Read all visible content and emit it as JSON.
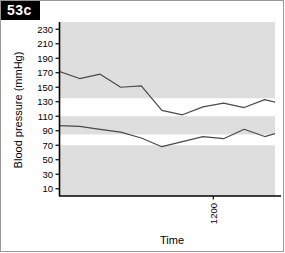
{
  "panel": {
    "tag": "53c"
  },
  "chart_data": {
    "type": "line",
    "title": "",
    "xlabel": "Time",
    "ylabel": "Blood pressure (mmHg)",
    "ylim": [
      0,
      240
    ],
    "yticks": [
      230,
      210,
      190,
      170,
      150,
      130,
      110,
      90,
      70,
      50,
      30,
      10
    ],
    "xlim": [
      1050,
      1260
    ],
    "xticks": [
      1200,
      1500,
      1800,
      2100,
      2400,
      2700,
      3000,
      3300,
      3600
    ],
    "xticklabels": [
      "1200",
      "1500",
      "1800",
      "2100",
      "0000",
      "0300",
      "0600",
      "0900",
      "1200"
    ],
    "grid": false,
    "legend": false,
    "shaded_bands": {
      "description": "Grey = outside reference range; white horizontal corridors = normal systolic and diastolic reference ranges, which step down during the nocturnal period",
      "color_grey": "#dedede",
      "color_white": "#ffffff",
      "systolic_band_day": [
        110,
        135
      ],
      "systolic_band_night": [
        95,
        120
      ],
      "diastolic_band_day": [
        70,
        85
      ],
      "diastolic_band_night": [
        55,
        75
      ],
      "night_start_time": "2200",
      "night_end_time": "0700"
    },
    "series": [
      {
        "name": "Systolic",
        "color": "#4a4a4a",
        "x": [
          1050,
          1070,
          1090,
          1110,
          1130,
          1150,
          1170,
          1190,
          1210,
          1230,
          1250,
          1270,
          1290,
          1310,
          1330,
          1350,
          1370,
          1390,
          1410,
          1430,
          1450,
          1470,
          1490,
          1510,
          1530,
          1550,
          1570,
          1590,
          1610,
          1630,
          1650,
          1670,
          1690,
          1710,
          1730,
          1750,
          1770,
          1790,
          1810,
          1830,
          1850,
          1870,
          1890,
          1910,
          1930,
          1950,
          1970,
          1990,
          2010,
          2030,
          2050,
          2070,
          2090,
          2110,
          2130,
          2150,
          2170,
          2190,
          2210
        ],
        "values": [
          172,
          162,
          168,
          150,
          152,
          118,
          112,
          123,
          128,
          122,
          133,
          126,
          132,
          120,
          129,
          121,
          133,
          126,
          124,
          122,
          123,
          124,
          128,
          122,
          126,
          127,
          121,
          120,
          125,
          117,
          118,
          111,
          123,
          114,
          112,
          122,
          112,
          124,
          118,
          117,
          140,
          116,
          106,
          113,
          110,
          116,
          109,
          116,
          111,
          110,
          117,
          107,
          104,
          102,
          107,
          96,
          98,
          106,
          112
        ]
      },
      {
        "name": "Diastolic",
        "color": "#4a4a4a",
        "x": [
          1050,
          1070,
          1090,
          1110,
          1130,
          1150,
          1170,
          1190,
          1210,
          1230,
          1250,
          1270,
          1290,
          1310,
          1330,
          1350,
          1370,
          1390,
          1410,
          1430,
          1450,
          1470,
          1490,
          1510,
          1530,
          1550,
          1570,
          1590,
          1610,
          1630,
          1650,
          1670,
          1690,
          1710,
          1730,
          1750,
          1770,
          1790,
          1810,
          1830,
          1850,
          1870,
          1890,
          1910,
          1930,
          1950,
          1970,
          1990,
          2010,
          2030,
          2050,
          2070,
          2090,
          2110,
          2130,
          2150,
          2170,
          2190,
          2210
        ],
        "values": [
          97,
          96,
          92,
          88,
          80,
          68,
          75,
          82,
          79,
          92,
          82,
          90,
          90,
          88,
          86,
          81,
          79,
          78,
          76,
          75,
          74,
          73,
          80,
          73,
          83,
          76,
          73,
          84,
          77,
          72,
          88,
          68,
          78,
          74,
          66,
          83,
          70,
          79,
          72,
          69,
          66,
          70,
          80,
          72,
          64,
          64,
          65,
          65,
          67,
          62,
          58,
          66,
          62,
          43,
          58,
          68,
          74,
          64,
          70
        ]
      }
    ]
  }
}
